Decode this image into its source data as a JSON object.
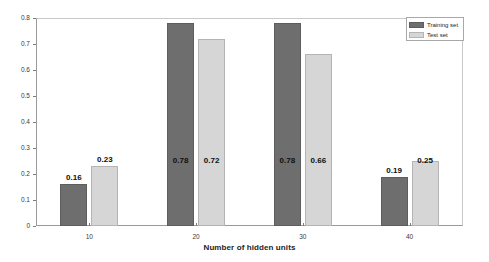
{
  "chart_data": {
    "type": "bar",
    "title": "",
    "xlabel": "Number of hidden units",
    "ylabel": "",
    "categories": [
      "10",
      "20",
      "30",
      "40"
    ],
    "series": [
      {
        "name": "Training set",
        "color": "#6e6e6e",
        "values": [
          0.16,
          0.78,
          0.78,
          0.19
        ],
        "labels": [
          "0.16",
          "0.78",
          "0.78",
          "0.19"
        ]
      },
      {
        "name": "Test set",
        "color": "#d6d6d6",
        "values": [
          0.23,
          0.72,
          0.66,
          0.25
        ],
        "labels": [
          "0.23",
          "0.72",
          "0.66",
          "0.25"
        ]
      }
    ],
    "ylim": [
      0,
      0.8
    ],
    "yticks": [
      "0",
      "0.1",
      "0.2",
      "0.3",
      "0.4",
      "0.5",
      "0.6",
      "0.7",
      "0.8"
    ],
    "ytick_values": [
      0,
      0.1,
      0.2,
      0.3,
      0.4,
      0.5,
      0.6,
      0.7,
      0.8
    ],
    "xticks": [
      "10",
      "20",
      "30",
      "40"
    ],
    "grid": false,
    "legend_position": "top-right"
  },
  "legend": {
    "entries": [
      {
        "label": "Training set"
      },
      {
        "label": "Test set"
      }
    ]
  },
  "axes": {
    "x_title": "Number of hidden units"
  }
}
